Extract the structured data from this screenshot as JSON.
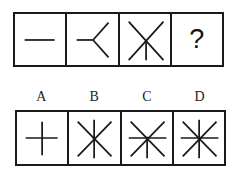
{
  "puzzle": {
    "stroke_color": "#1a1a1a",
    "stroke_width": 1.8,
    "center_dot_radius": 1.6,
    "sequence": [
      {
        "id": "seq-1",
        "kind": "figure",
        "description": "single horizontal line",
        "ray_count": 2,
        "lines": [
          [
            10,
            27,
            41,
            27
          ]
        ],
        "dot": null
      },
      {
        "id": "seq-2",
        "kind": "figure",
        "description": "Y shape opening to the right",
        "ray_count": 3,
        "lines": [
          [
            10,
            27,
            27,
            27
          ],
          [
            27,
            27,
            43,
            9
          ],
          [
            27,
            27,
            43,
            45
          ]
        ],
        "dot": null
      },
      {
        "id": "seq-3",
        "kind": "figure",
        "description": "X with half vertical line downward",
        "ray_count": 5,
        "lines": [
          [
            9,
            8,
            45,
            48
          ],
          [
            45,
            8,
            9,
            48
          ],
          [
            27,
            28,
            27,
            48
          ]
        ],
        "dot": null
      },
      {
        "id": "seq-4",
        "kind": "unknown",
        "text": "?"
      }
    ],
    "options_label_list": [
      "A",
      "B",
      "C",
      "D"
    ],
    "options": [
      {
        "label": "A",
        "description": "plus sign",
        "ray_count": 4,
        "lines": [
          [
            9,
            27,
            42,
            27
          ],
          [
            26,
            10,
            26,
            45
          ]
        ],
        "dot": null
      },
      {
        "label": "B",
        "description": "X with full vertical line",
        "ray_count": 6,
        "lines": [
          [
            9,
            10,
            44,
            46
          ],
          [
            44,
            10,
            9,
            46
          ],
          [
            26,
            8,
            26,
            48
          ]
        ],
        "dot": [
          26,
          27
        ]
      },
      {
        "label": "C",
        "description": "X with full horizontal line and half vertical downward",
        "ray_count": 7,
        "lines": [
          [
            9,
            10,
            44,
            46
          ],
          [
            44,
            10,
            9,
            46
          ],
          [
            7,
            27,
            46,
            27
          ],
          [
            26,
            27,
            26,
            48
          ]
        ],
        "dot": [
          26,
          27
        ]
      },
      {
        "label": "D",
        "description": "X with full horizontal and full vertical lines",
        "ray_count": 8,
        "lines": [
          [
            9,
            10,
            44,
            46
          ],
          [
            44,
            10,
            9,
            46
          ],
          [
            7,
            27,
            46,
            27
          ],
          [
            26,
            8,
            26,
            48
          ]
        ],
        "dot": [
          26,
          27
        ]
      }
    ]
  }
}
